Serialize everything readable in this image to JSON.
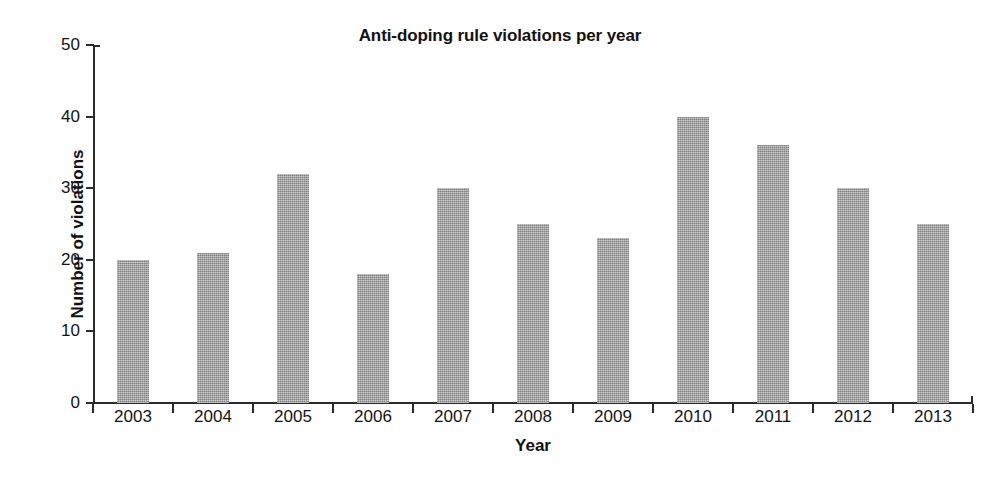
{
  "chart_data": {
    "type": "bar",
    "title": "Anti-doping rule violations per year",
    "xlabel": "Year",
    "ylabel": "Number of violations",
    "categories": [
      "2003",
      "2004",
      "2005",
      "2006",
      "2007",
      "2008",
      "2009",
      "2010",
      "2011",
      "2012",
      "2013"
    ],
    "values": [
      20,
      21,
      32,
      18,
      30,
      25,
      23,
      40,
      36,
      30,
      25
    ],
    "ylim": [
      0,
      50
    ],
    "yticks": [
      0,
      10,
      20,
      30,
      40,
      50
    ],
    "ytick_labels": [
      "0",
      "10",
      "20",
      "30",
      "40",
      "50"
    ],
    "grid": false,
    "legend": null,
    "bar_color": "#9b9b9b",
    "axis_color": "#2b2b2b",
    "background_color": "#fefefe"
  }
}
